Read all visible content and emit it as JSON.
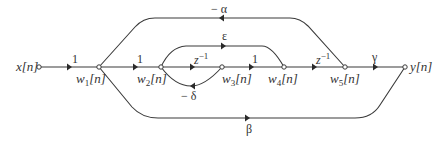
{
  "diagram": {
    "type": "signal-flow-graph",
    "nodes": [
      {
        "id": "x",
        "label": "x[n]",
        "cx": 39,
        "cy": 67
      },
      {
        "id": "w1",
        "label_main": "w",
        "label_sub": "1",
        "label_tail": "[n]",
        "cx": 99,
        "cy": 67
      },
      {
        "id": "w2",
        "label_main": "w",
        "label_sub": "2",
        "label_tail": "[n]",
        "cx": 161,
        "cy": 67
      },
      {
        "id": "w3",
        "label_main": "w",
        "label_sub": "3",
        "label_tail": "[n]",
        "cx": 222,
        "cy": 67
      },
      {
        "id": "w4",
        "label_main": "w",
        "label_sub": "4",
        "label_tail": "[n]",
        "cx": 284,
        "cy": 67
      },
      {
        "id": "w5",
        "label_main": "w",
        "label_sub": "5",
        "label_tail": "[n]",
        "cx": 345,
        "cy": 67
      },
      {
        "id": "y",
        "label": "y[n]",
        "cx": 405,
        "cy": 67
      }
    ],
    "edges": [
      {
        "from": "x[n]",
        "to": "w1[n]",
        "gain": "1"
      },
      {
        "from": "w1[n]",
        "to": "w2[n]",
        "gain": "1"
      },
      {
        "from": "w2[n]",
        "to": "w3[n]",
        "gain_base": "z",
        "gain_exp": "−1"
      },
      {
        "from": "w3[n]",
        "to": "w2[n]",
        "gain": "− δ"
      },
      {
        "from": "w2[n]",
        "to": "w4[n]",
        "gain": "ε"
      },
      {
        "from": "w3[n]",
        "to": "w4[n]",
        "gain": "1"
      },
      {
        "from": "w4[n]",
        "to": "w5[n]",
        "gain_base": "z",
        "gain_exp": "−1"
      },
      {
        "from": "w5[n]",
        "to": "w1[n]",
        "gain": "− α"
      },
      {
        "from": "w5[n]",
        "to": "y[n]",
        "gain": "γ"
      },
      {
        "from": "w1[n]",
        "to": "y[n]",
        "gain": "β"
      }
    ],
    "labels": {
      "x": "x[n]",
      "y": "y[n]",
      "w": "w",
      "n": "[n]",
      "s1": "1",
      "s2": "2",
      "s3": "3",
      "s4": "4",
      "s5": "5",
      "g_x_w1": "1",
      "g_w1_w2": "1",
      "g_w3_w4": "1",
      "z": "z",
      "zexp": "−1",
      "alpha": "− α",
      "beta": "β",
      "gamma": "γ",
      "delta": "− δ",
      "epsilon": "ε"
    },
    "colors": {
      "line": "#3a3a3a",
      "text": "#333333",
      "background": "#ffffff"
    }
  }
}
